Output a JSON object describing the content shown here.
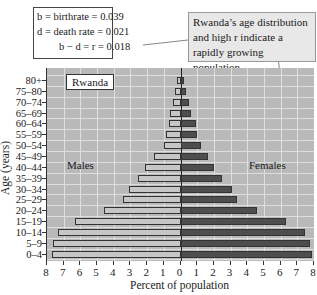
{
  "chart_data": {
    "type": "bar",
    "subtype": "population-pyramid",
    "title": "Rwanda",
    "xlabel": "Percent of population",
    "ylabel": "Age (years)",
    "xlim": [
      -8,
      8
    ],
    "x_ticks": [
      "8",
      "7",
      "6",
      "5",
      "4",
      "3",
      "2",
      "1",
      "0",
      "1",
      "2",
      "3",
      "4",
      "5",
      "6",
      "7",
      "8"
    ],
    "categories": [
      "80+",
      "75–80",
      "70–74",
      "65–69",
      "60–64",
      "55–59",
      "50–54",
      "45–49",
      "40–44",
      "35–39",
      "30–34",
      "25–29",
      "20–24",
      "15–19",
      "10–14",
      "5–9",
      "0–4"
    ],
    "series": [
      {
        "name": "Males",
        "color": "#c6c6c6",
        "values": [
          0.2,
          0.3,
          0.45,
          0.6,
          0.7,
          0.85,
          1.0,
          1.6,
          2.1,
          2.55,
          3.1,
          3.45,
          4.6,
          6.3,
          7.35,
          7.65,
          7.7
        ]
      },
      {
        "name": "Females",
        "color": "#4e4e4e",
        "values": [
          0.2,
          0.3,
          0.5,
          0.65,
          0.9,
          1.0,
          1.2,
          1.65,
          2.0,
          2.5,
          3.1,
          3.4,
          4.6,
          6.3,
          7.45,
          7.75,
          7.9
        ]
      }
    ],
    "grid": true,
    "annotations": [
      "b = birthrate = 0.039",
      "d = death rate = 0.021",
      "b − d = r = 0.018",
      "Rwanda's age distribution and high r indicate a rapidly growing population."
    ]
  },
  "labels": {
    "country": "Rwanda",
    "males": "Males",
    "females": "Females",
    "xaxis": "Percent of population",
    "yaxis": "Age (years)"
  },
  "stats_box": {
    "line1": "b =  birthrate = 0.039",
    "line2": "d = death rate = 0.021",
    "line3": "b − d = r = 0.018"
  },
  "callout": {
    "text": "Rwanda’s age distribution and high r indicate a rapidly growing population."
  }
}
